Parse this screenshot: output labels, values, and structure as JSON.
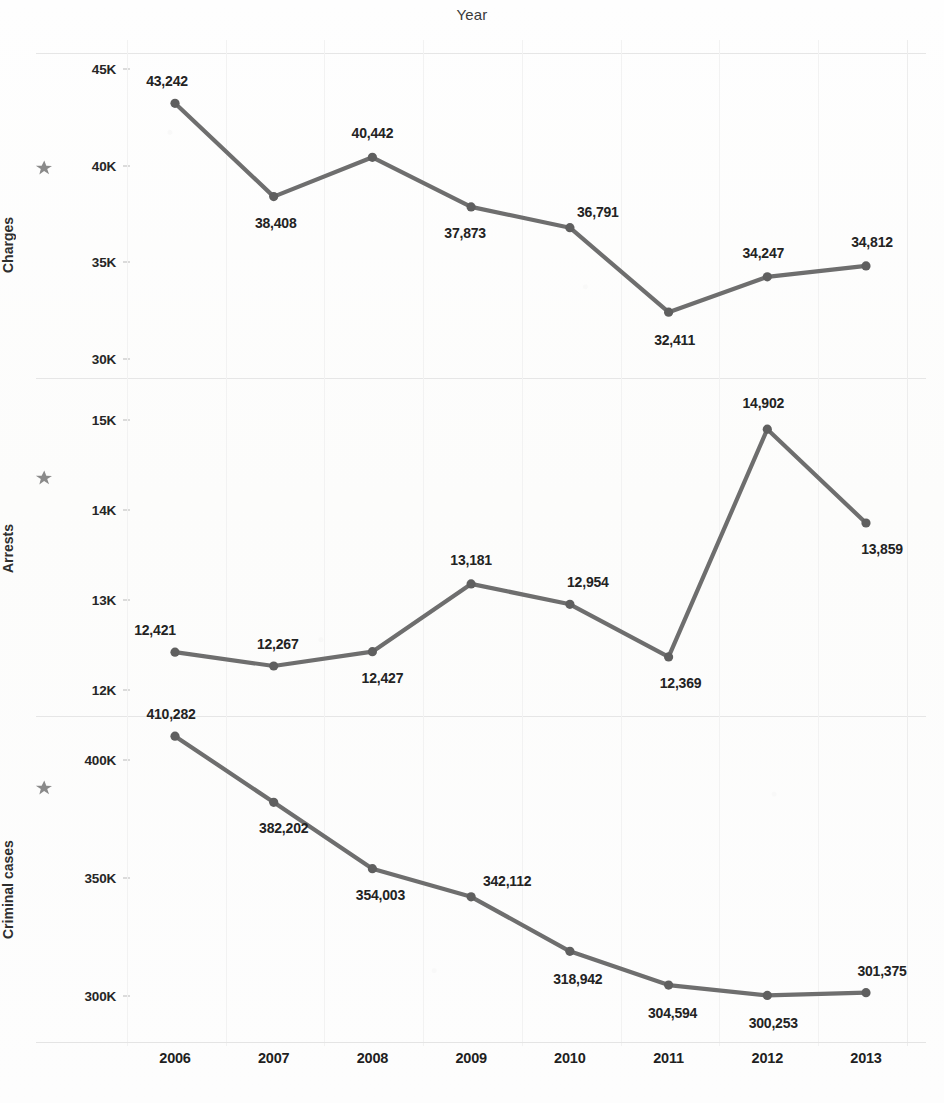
{
  "chart_title": "Year",
  "colors": {
    "line": "#6e6e6e",
    "marker": "#5f5f5f",
    "text": "#232323",
    "grid": "#ededed",
    "star": "#8a8a8a",
    "background": "#fdfdfc"
  },
  "icons": {
    "sort_star": "star-icon"
  },
  "x_axis": {
    "label": "Year",
    "categories": [
      "2006",
      "2007",
      "2008",
      "2009",
      "2010",
      "2011",
      "2012",
      "2013"
    ]
  },
  "panels": [
    {
      "id": "charges",
      "axis_label": "Charges",
      "y_ticks": [
        "45K",
        "40K",
        "35K",
        "30K"
      ],
      "y_tick_values": [
        45000,
        40000,
        35000,
        30000
      ],
      "point_labels": [
        "43,242",
        "38,408",
        "40,442",
        "37,873",
        "36,791",
        "32,411",
        "34,247",
        "34,812"
      ]
    },
    {
      "id": "arrests",
      "axis_label": "Arrests",
      "y_ticks": [
        "15K",
        "14K",
        "13K",
        "12K"
      ],
      "y_tick_values": [
        15000,
        14000,
        13000,
        12000
      ],
      "point_labels": [
        "12,421",
        "12,267",
        "12,427",
        "13,181",
        "12,954",
        "12,369",
        "14,902",
        "13,859"
      ]
    },
    {
      "id": "cases",
      "axis_label": "Criminal cases",
      "y_ticks": [
        "400K",
        "350K",
        "300K"
      ],
      "y_tick_values": [
        400000,
        350000,
        300000
      ],
      "point_labels": [
        "410,282",
        "382,202",
        "354,003",
        "342,112",
        "318,942",
        "304,594",
        "300,253",
        "301,375"
      ]
    }
  ],
  "chart_data": {
    "type": "line",
    "title": "Year",
    "xlabel": "Year",
    "x": [
      2006,
      2007,
      2008,
      2009,
      2010,
      2011,
      2012,
      2013
    ],
    "categories": [
      "2006",
      "2007",
      "2008",
      "2009",
      "2010",
      "2011",
      "2012",
      "2013"
    ],
    "panels": [
      {
        "name": "Charges",
        "ylabel": "Charges",
        "values": [
          43242,
          38408,
          40442,
          37873,
          36791,
          32411,
          34247,
          34812
        ],
        "ylim": [
          29000,
          45800
        ],
        "yticks": [
          30000,
          35000,
          40000,
          45000
        ],
        "ytick_labels": [
          "30K",
          "35K",
          "40K",
          "45K"
        ],
        "data_labels": [
          "43,242",
          "38,408",
          "40,442",
          "37,873",
          "36,791",
          "32,411",
          "34,247",
          "34,812"
        ]
      },
      {
        "name": "Arrests",
        "ylabel": "Arrests",
        "values": [
          12421,
          12267,
          12427,
          13181,
          12954,
          12369,
          14902,
          13859
        ],
        "ylim": [
          11800,
          15450
        ],
        "yticks": [
          12000,
          13000,
          14000,
          15000
        ],
        "ytick_labels": [
          "12K",
          "13K",
          "14K",
          "15K"
        ],
        "data_labels": [
          "12,421",
          "12,267",
          "12,427",
          "13,181",
          "12,954",
          "12,369",
          "14,902",
          "13,859"
        ]
      },
      {
        "name": "Criminal cases",
        "ylabel": "Criminal cases",
        "values": [
          410282,
          382202,
          354003,
          342112,
          318942,
          304594,
          300253,
          301375
        ],
        "ylim": [
          283000,
          418000
        ],
        "yticks": [
          300000,
          350000,
          400000
        ],
        "ytick_labels": [
          "300K",
          "350K",
          "400K"
        ],
        "data_labels": [
          "410,282",
          "382,202",
          "354,003",
          "342,112",
          "318,942",
          "304,594",
          "300,253",
          "301,375"
        ]
      }
    ],
    "grid": true,
    "legend": "none",
    "marker": "circle",
    "series_color": "#6e6e6e"
  }
}
